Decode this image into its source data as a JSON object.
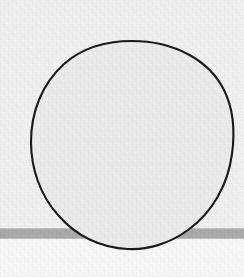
{
  "image": {
    "kind": "scanned-drawing",
    "width": 244,
    "height": 277,
    "background_color": "#f2f2f2",
    "upper_field_color": "#f0f0f0",
    "lower_field_color": "#f7f7f7"
  },
  "shapes": {
    "circle": {
      "name": "large-circle",
      "stroke_color": "#151515",
      "fill_color": "#ebebeb",
      "stroke_width": 2,
      "center_x": 132,
      "center_y": 145,
      "radius_x": 102,
      "radius_y": 105
    },
    "band": {
      "name": "horizontal-gray-band",
      "color": "#a9a9a9",
      "top_edge_color": "#c2c2c2",
      "bottom_edge_color": "#bcbcbc",
      "y": 228,
      "height": 11,
      "full_width": true
    }
  },
  "watermark": {
    "text": "",
    "color": "#fbfbfb",
    "legible": false
  }
}
